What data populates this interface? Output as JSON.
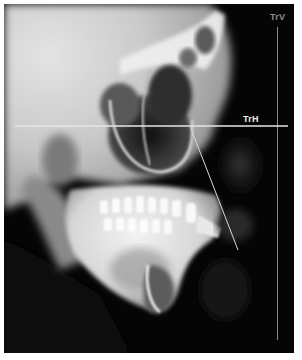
{
  "figure": {
    "colors": {
      "background": "#050505",
      "bone": "#e8e8e8",
      "line_trh": "#e6e6e6",
      "line_trv": "#8a8a8a",
      "line_diag": "#d8d8d8"
    }
  },
  "overlays": {
    "vertical_line": {
      "label": "TrV",
      "x": 277,
      "y1": 27,
      "y2": 340
    },
    "horizontal_line": {
      "label": "TrH",
      "y": 126,
      "x1": 15,
      "x2": 288
    },
    "diagonal_line": {
      "x1": 190,
      "y1": 126,
      "x2": 238,
      "y2": 250
    }
  }
}
